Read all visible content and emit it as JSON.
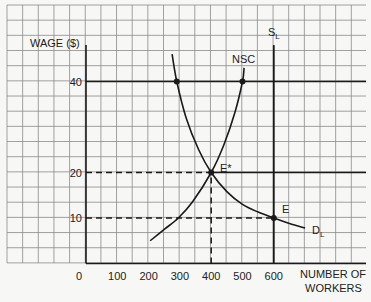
{
  "chart_data": {
    "type": "line",
    "title": "",
    "xlabel": "NUMBER OF WORKERS",
    "ylabel": "WAGE ($)",
    "xlim": [
      0,
      900
    ],
    "ylim": [
      0,
      57
    ],
    "x_ticks": [
      0,
      100,
      200,
      300,
      400,
      500,
      600
    ],
    "x_tick_labels": [
      "0",
      "100",
      "200",
      "300",
      "400",
      "500",
      "600"
    ],
    "y_ticks": [
      10,
      20,
      40
    ],
    "y_tick_labels": [
      "10",
      "20",
      "40"
    ],
    "grid": true,
    "legend": null,
    "series": [
      {
        "name": "D_L",
        "label": "D",
        "label_sub": "L",
        "points": [
          [
            275,
            46
          ],
          [
            290,
            40
          ],
          [
            320,
            32
          ],
          [
            360,
            25
          ],
          [
            400,
            20
          ],
          [
            450,
            15.8
          ],
          [
            500,
            13
          ],
          [
            550,
            11.3
          ],
          [
            600,
            10
          ],
          [
            650,
            8.8
          ],
          [
            700,
            7.8
          ]
        ]
      },
      {
        "name": "NSC",
        "label": "NSC",
        "points": [
          [
            205,
            5
          ],
          [
            250,
            7.5
          ],
          [
            295,
            10
          ],
          [
            340,
            13.5
          ],
          [
            400,
            20
          ],
          [
            440,
            26
          ],
          [
            475,
            33
          ],
          [
            500,
            40
          ],
          [
            505,
            43
          ]
        ]
      },
      {
        "name": "S_L",
        "label": "S",
        "label_sub": "L",
        "points": [
          [
            600,
            0
          ],
          [
            600,
            48
          ]
        ]
      }
    ],
    "reference_lines": [
      {
        "type": "horizontal",
        "wage": 40,
        "style": "solid",
        "from_workers": 0,
        "to_workers": "edge"
      },
      {
        "type": "horizontal",
        "wage": 20,
        "style": "dashed",
        "from_workers": 0,
        "to_workers": 400
      },
      {
        "type": "horizontal",
        "wage": 20,
        "style": "solid",
        "from_workers": 400,
        "to_workers": "edge"
      },
      {
        "type": "horizontal",
        "wage": 10,
        "style": "dashed",
        "from_workers": 0,
        "to_workers": 600
      },
      {
        "type": "vertical",
        "workers": 400,
        "style": "dashed",
        "from_wage": 0,
        "to_wage": 20
      }
    ],
    "annotations": [
      {
        "label": "E*",
        "workers": 400,
        "wage": 20,
        "marker": true
      },
      {
        "label": "E",
        "workers": 600,
        "wage": 10,
        "marker": true
      },
      {
        "label": "",
        "workers": 290,
        "wage": 40,
        "marker": true
      },
      {
        "label": "",
        "workers": 500,
        "wage": 40,
        "marker": true
      }
    ]
  },
  "labels": {
    "ylabel": "WAGE ($)",
    "xlabel_line1": "NUMBER OF",
    "xlabel_line2": "WORKERS",
    "nsc": "NSC",
    "sl_main": "S",
    "sl_sub": "L",
    "dl_main": "D",
    "dl_sub": "L",
    "e_star": "E*",
    "e": "E"
  },
  "colors": {
    "grid": "#8a8a8a",
    "ink": "#1a1a1a",
    "background": "#f7f7f5"
  }
}
